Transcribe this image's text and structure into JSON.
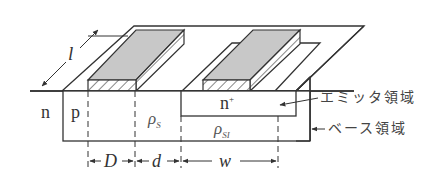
{
  "diagram": {
    "colors": {
      "line": "#333333",
      "electrode_top": "#c8c8c8",
      "hatch": "#555555",
      "background": "#ffffff"
    },
    "labels": {
      "length": "l",
      "n_region": "n",
      "p_region": "p",
      "rho_s": "ρ",
      "rho_s_sub": "S",
      "n_plus": "n",
      "n_plus_sup": "+",
      "rho_si": "ρ",
      "rho_si_sub": "SI",
      "emitter_region": "エミッタ領域",
      "base_region": "ベース領域",
      "dim_D": "D",
      "dim_d": "d",
      "dim_w": "w"
    }
  }
}
